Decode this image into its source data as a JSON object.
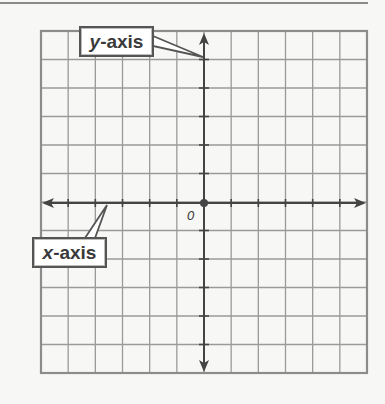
{
  "diagram": {
    "type": "coordinate-plane",
    "grid": {
      "columns": 12,
      "rows": 12,
      "left": 41,
      "top": 31,
      "right": 367,
      "bottom": 373,
      "gridline_color": "#9a9a9a",
      "border_color": "#8c8c8c"
    },
    "axes": {
      "color": "#444444",
      "origin": {
        "x": 204,
        "y": 203
      },
      "x_axis": {
        "from": 42,
        "to": 366,
        "arrows": "both"
      },
      "y_axis": {
        "from": 33,
        "to": 372,
        "arrows": "both"
      }
    },
    "labels": {
      "origin": "0",
      "y_axis_callout": {
        "var": "y",
        "rest": "-axis"
      },
      "x_axis_callout": {
        "var": "x",
        "rest": "-axis"
      }
    }
  }
}
